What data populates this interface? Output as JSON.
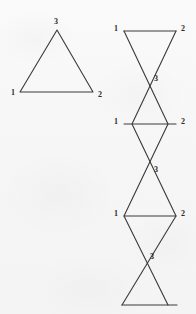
{
  "figure": {
    "canvas": {
      "width": 196,
      "height": 314
    },
    "background_color": "#f6f6f6",
    "stroke_color": "#3a3a3a",
    "stroke_width": 1.1,
    "label_color": "#2b2b2b",
    "panels": [
      {
        "id": "single-triangle",
        "name": "single-triangle-panel",
        "description": "upright triangle with vertices labelled 1, 2, 3",
        "polylines": [
          {
            "name": "triangle-outline",
            "points": "20,92 57,30 93,92 20,92"
          }
        ],
        "labels": [
          {
            "name": "vertex-label-3",
            "text": "3",
            "x": 56,
            "y": 22
          },
          {
            "name": "vertex-label-1",
            "text": "1",
            "x": 13,
            "y": 93
          },
          {
            "name": "vertex-label-2",
            "text": "2",
            "x": 100,
            "y": 95
          }
        ]
      },
      {
        "id": "triangle-strip",
        "name": "triangle-strip-panel",
        "description": "vertical chain of triangles alternating up and down, crossing at vertex 3, repeating labels 1 and 2 on horizontal bars",
        "polylines": [
          {
            "name": "strip-bar-top",
            "points": "124,31 176,31"
          },
          {
            "name": "strip-bar-second",
            "points": "124,124 176,124"
          },
          {
            "name": "strip-bar-third",
            "points": "124,216 176,216"
          },
          {
            "name": "strip-bar-bottom",
            "points": "122,305 177,305"
          },
          {
            "name": "strip-zigzag-left",
            "points": "124,31 168,124 124,216 168,305"
          },
          {
            "name": "strip-zigzag-right",
            "points": "176,31 132,124 176,216 122,305"
          }
        ],
        "labels": [
          {
            "name": "strip-vertex-label-1-a",
            "text": "1",
            "x": 116,
            "y": 29
          },
          {
            "name": "strip-vertex-label-2-a",
            "text": "2",
            "x": 183,
            "y": 29
          },
          {
            "name": "strip-vertex-label-3-a",
            "text": "3",
            "x": 156,
            "y": 79
          },
          {
            "name": "strip-vertex-label-1-b",
            "text": "1",
            "x": 116,
            "y": 122
          },
          {
            "name": "strip-vertex-label-2-b",
            "text": "2",
            "x": 183,
            "y": 122
          },
          {
            "name": "strip-vertex-label-3-b",
            "text": "3",
            "x": 156,
            "y": 170
          },
          {
            "name": "strip-vertex-label-1-c",
            "text": "1",
            "x": 116,
            "y": 214
          },
          {
            "name": "strip-vertex-label-2-c",
            "text": "2",
            "x": 183,
            "y": 214
          },
          {
            "name": "strip-vertex-label-3-c",
            "text": "3",
            "x": 152,
            "y": 257
          }
        ]
      }
    ]
  }
}
